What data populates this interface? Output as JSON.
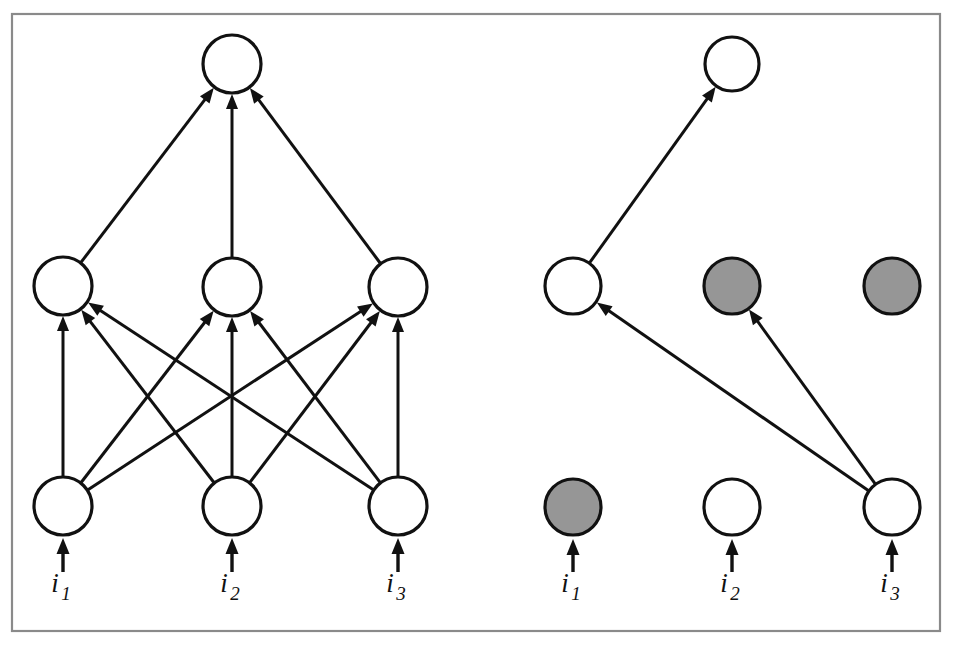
{
  "figure": {
    "width": 953,
    "height": 648,
    "background_color": "#ffffff",
    "frame": {
      "x": 12,
      "y": 14,
      "width": 928,
      "height": 617,
      "stroke_color": "#8a8a8a"
    },
    "colors": {
      "stroke": "#111111",
      "node_active_fill": "#ffffff",
      "node_dropped_fill": "#969696",
      "frame": "#8a8a8a"
    },
    "node_radius": 28,
    "output_node_radius": 28
  },
  "panels": [
    {
      "id": "left-panel",
      "name": "standard-neural-network",
      "nodes": [
        {
          "id": "L-out-1",
          "layer": "output",
          "index": 1,
          "cx": 232,
          "cy": 64,
          "r": 29,
          "state": "active",
          "fill": "#ffffff"
        },
        {
          "id": "L-hidden-1",
          "layer": "hidden",
          "index": 1,
          "cx": 63,
          "cy": 286,
          "r": 29,
          "state": "active",
          "fill": "#ffffff"
        },
        {
          "id": "L-hidden-2",
          "layer": "hidden",
          "index": 2,
          "cx": 232,
          "cy": 287,
          "r": 29,
          "state": "active",
          "fill": "#ffffff"
        },
        {
          "id": "L-hidden-3",
          "layer": "hidden",
          "index": 3,
          "cx": 398,
          "cy": 287,
          "r": 29,
          "state": "active",
          "fill": "#ffffff"
        },
        {
          "id": "L-input-1",
          "layer": "input",
          "index": 1,
          "cx": 63,
          "cy": 506,
          "r": 29,
          "state": "active",
          "fill": "#ffffff"
        },
        {
          "id": "L-input-2",
          "layer": "input",
          "index": 2,
          "cx": 232,
          "cy": 506,
          "r": 29,
          "state": "active",
          "fill": "#ffffff"
        },
        {
          "id": "L-input-3",
          "layer": "input",
          "index": 3,
          "cx": 398,
          "cy": 506,
          "r": 29,
          "state": "active",
          "fill": "#ffffff"
        }
      ],
      "edges": [
        {
          "from": "L-hidden-1",
          "to": "L-out-1"
        },
        {
          "from": "L-hidden-2",
          "to": "L-out-1"
        },
        {
          "from": "L-hidden-3",
          "to": "L-out-1"
        },
        {
          "from": "L-input-1",
          "to": "L-hidden-1"
        },
        {
          "from": "L-input-1",
          "to": "L-hidden-2"
        },
        {
          "from": "L-input-1",
          "to": "L-hidden-3"
        },
        {
          "from": "L-input-2",
          "to": "L-hidden-1"
        },
        {
          "from": "L-input-2",
          "to": "L-hidden-2"
        },
        {
          "from": "L-input-2",
          "to": "L-hidden-3"
        },
        {
          "from": "L-input-3",
          "to": "L-hidden-1"
        },
        {
          "from": "L-input-3",
          "to": "L-hidden-2"
        },
        {
          "from": "L-input-3",
          "to": "L-hidden-3"
        }
      ],
      "input_arrows": [
        {
          "x": 63,
          "y_from": 572,
          "y_to": 538,
          "target": "L-input-1"
        },
        {
          "x": 232,
          "y_from": 572,
          "y_to": 538,
          "target": "L-input-2"
        },
        {
          "x": 398,
          "y_from": 572,
          "y_to": 538,
          "target": "L-input-3"
        }
      ],
      "input_labels": [
        {
          "base": "i",
          "sub": "1",
          "x": 63,
          "y": 592
        },
        {
          "base": "i",
          "sub": "2",
          "x": 232,
          "y": 592
        },
        {
          "base": "i",
          "sub": "3",
          "x": 398,
          "y": 592
        }
      ]
    },
    {
      "id": "right-panel",
      "name": "thinned-neural-network-after-dropout",
      "nodes": [
        {
          "id": "R-out-1",
          "layer": "output",
          "index": 1,
          "cx": 732,
          "cy": 64,
          "r": 27,
          "state": "active",
          "fill": "#ffffff"
        },
        {
          "id": "R-hidden-1",
          "layer": "hidden",
          "index": 1,
          "cx": 573,
          "cy": 286,
          "r": 28,
          "state": "active",
          "fill": "#ffffff"
        },
        {
          "id": "R-hidden-2",
          "layer": "hidden",
          "index": 2,
          "cx": 732,
          "cy": 286,
          "r": 28,
          "state": "dropped",
          "fill": "#969696"
        },
        {
          "id": "R-hidden-3",
          "layer": "hidden",
          "index": 3,
          "cx": 892,
          "cy": 286,
          "r": 28,
          "state": "dropped",
          "fill": "#969696"
        },
        {
          "id": "R-input-1",
          "layer": "input",
          "index": 1,
          "cx": 573,
          "cy": 507,
          "r": 28,
          "state": "dropped",
          "fill": "#969696"
        },
        {
          "id": "R-input-2",
          "layer": "input",
          "index": 2,
          "cx": 732,
          "cy": 507,
          "r": 28,
          "state": "active",
          "fill": "#ffffff"
        },
        {
          "id": "R-input-3",
          "layer": "input",
          "index": 3,
          "cx": 892,
          "cy": 507,
          "r": 28,
          "state": "active",
          "fill": "#ffffff"
        }
      ],
      "edges": [
        {
          "from": "R-hidden-1",
          "to": "R-out-1"
        },
        {
          "from": "R-input-3",
          "to": "R-hidden-1"
        },
        {
          "from": "R-input-3",
          "to": "R-hidden-2"
        }
      ],
      "input_arrows": [
        {
          "x": 573,
          "y_from": 572,
          "y_to": 539,
          "target": "R-input-1"
        },
        {
          "x": 732,
          "y_from": 572,
          "y_to": 539,
          "target": "R-input-2"
        },
        {
          "x": 892,
          "y_from": 572,
          "y_to": 539,
          "target": "R-input-3"
        }
      ],
      "input_labels": [
        {
          "base": "i",
          "sub": "1",
          "x": 573,
          "y": 592
        },
        {
          "base": "i",
          "sub": "2",
          "x": 732,
          "y": 592
        },
        {
          "base": "i",
          "sub": "3",
          "x": 892,
          "y": 592
        }
      ]
    }
  ]
}
